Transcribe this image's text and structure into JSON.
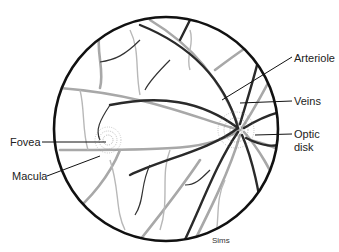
{
  "labels": {
    "arteriole": "Arteriole",
    "veins": "Veins",
    "optic_disk_line1": "Optic",
    "optic_disk_line2": "disk",
    "fovea": "Fovea",
    "macula": "Macula"
  },
  "credit": "Sims",
  "colors": {
    "outline": "#111111",
    "vein": "#2a2a2a",
    "artery": "#a8a8a8",
    "stipple": "#555555"
  }
}
